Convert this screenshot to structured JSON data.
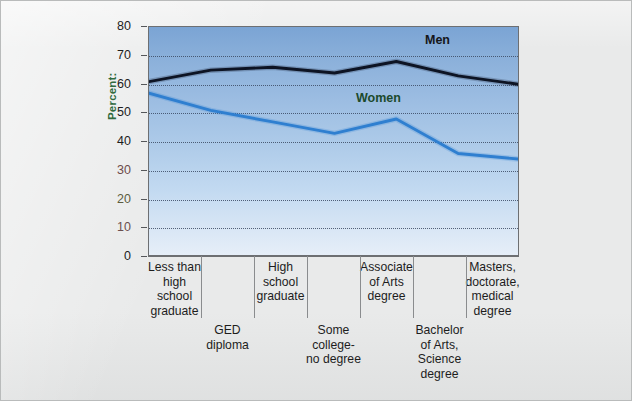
{
  "figure": {
    "background_color": "#e9eaea",
    "plot_background_top": "#7ba4d4",
    "plot_background_bottom": "#e6eef8"
  },
  "axis": {
    "y_title": "Percent:",
    "y_ticks": [
      "80",
      "70",
      "60",
      "50",
      "40",
      "30",
      "20",
      "10",
      "0"
    ],
    "y_tick_colors": [
      "#1d1d1d",
      "#1d1d1d",
      "#1d1d1d",
      "#1d1d1d",
      "#1d1d1d",
      "#6d4b4b",
      "#5c5c3f",
      "#6b4f4f",
      "#1d1d1d"
    ]
  },
  "series_labels": {
    "men": "Men",
    "women": "Women"
  },
  "x_labels": {
    "upper": [
      "Less than\nhigh\nschool\ngraduate",
      "High\nschool\ngraduate",
      "Associate\nof Arts\ndegree",
      "Masters,\ndoctorate,\nmedical\ndegree"
    ],
    "lower": [
      "GED\ndiploma",
      "Some\ncollege-\nno degree",
      "Bachelor\nof Arts,\nScience\ndegree"
    ]
  },
  "chart_data": {
    "type": "line",
    "title": "",
    "xlabel": "",
    "ylabel": "Percent:",
    "ylim": [
      0,
      80
    ],
    "ytick_step": 10,
    "grid": true,
    "legend_position": "inline-annotations",
    "categories": [
      "Less than high school graduate",
      "GED diploma",
      "High school graduate",
      "Some college-no degree",
      "Associate of Arts degree",
      "Bachelor of Arts, Science degree",
      "Masters, doctorate, medical degree"
    ],
    "series": [
      {
        "name": "Men",
        "color": "#0d1424",
        "values": [
          61,
          65,
          66,
          64,
          68,
          63,
          60
        ]
      },
      {
        "name": "Women",
        "color": "#2f7fd0",
        "values": [
          57,
          51,
          47,
          43,
          48,
          36,
          34
        ]
      }
    ]
  }
}
